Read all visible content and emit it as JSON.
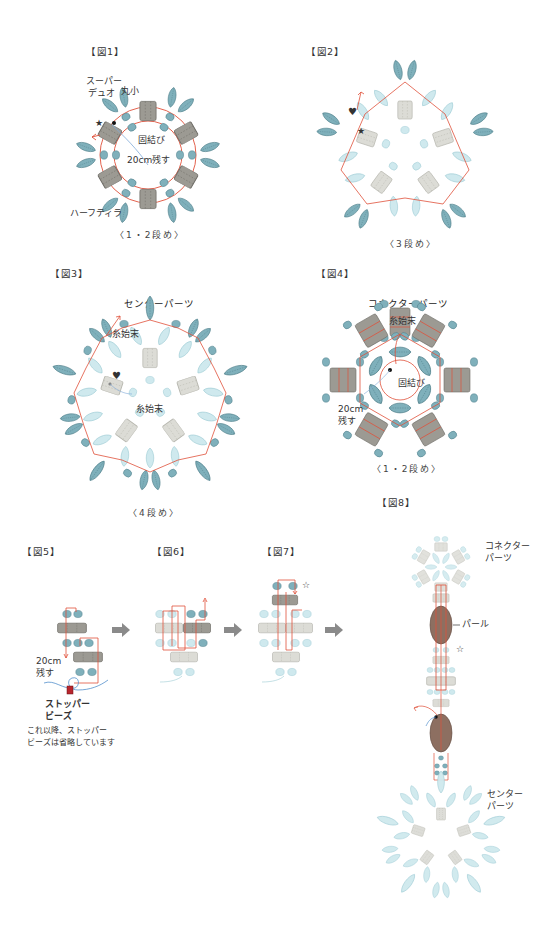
{
  "colors": {
    "teal_bead": "#7fb0bb",
    "teal_bead_dark": "#5e96a3",
    "light_bead": "#cfe9ee",
    "tila_dark": "#9c9a93",
    "tila_light": "#dcdcd6",
    "thread": "#e0503a",
    "pearl": "#8d6f61",
    "arrow_gray": "#8a8a8a",
    "stopper": "#b8262e"
  },
  "fig1": {
    "label": "【図1】",
    "annotations": {
      "superduo": "スーパー\nデュオ",
      "superduo_l1": "スーパー",
      "superduo_l2": "デュオ",
      "maru_small": "丸小",
      "knot": "固結び",
      "leave_20cm": "20cm残す",
      "half_tila": "ハーフティラ",
      "star": "★"
    },
    "caption": "〈1・2段め〉"
  },
  "fig2": {
    "label": "【図2】",
    "annotations": {
      "heart": "♥",
      "star": "★"
    },
    "caption": "〈3段め〉"
  },
  "fig3": {
    "label": "【図3】",
    "title": "センターパーツ",
    "annotations": {
      "thread_end_top": "糸始末",
      "thread_end_center": "糸始末",
      "heart": "♥"
    },
    "caption": "〈4段め〉"
  },
  "fig4": {
    "label": "【図4】",
    "title": "コネクターパーツ",
    "annotations": {
      "thread_end": "糸始末",
      "knot": "固結び",
      "leave_l1": "20cm",
      "leave_l2": "残す"
    },
    "caption": "〈1・2段め〉"
  },
  "fig5": {
    "label": "【図5】",
    "annotations": {
      "leave_l1": "20cm",
      "leave_l2": "残す",
      "stopper_l1": "ストッパー",
      "stopper_l2": "ビーズ",
      "note_l1": "これ以降、ストッパー",
      "note_l2": "ビーズは省略しています"
    }
  },
  "fig6": {
    "label": "【図6】"
  },
  "fig7": {
    "label": "【図7】",
    "annotations": {
      "star": "☆"
    }
  },
  "fig8": {
    "label": "【図8】",
    "annotations": {
      "connector_l1": "コネクター",
      "connector_l2": "パーツ",
      "pearl": "パール",
      "star": "☆",
      "center_l1": "センター",
      "center_l2": "パーツ"
    }
  }
}
